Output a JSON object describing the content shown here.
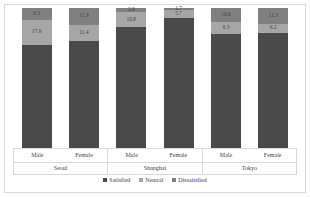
{
  "chart_data": {
    "type": "bar",
    "subtype": "100-percent-stacked-column",
    "title": "",
    "xlabel": "",
    "ylabel": "",
    "ylim": [
      0,
      100
    ],
    "grid": false,
    "legend_position": "bottom",
    "groups": [
      "Seoul",
      "Shanghai",
      "Tokyo"
    ],
    "categories": [
      "Male",
      "Female",
      "Male",
      "Female",
      "Male",
      "Female"
    ],
    "series": [
      {
        "name": "Satisfied",
        "color": "#4a4a4a",
        "values": [
          73.8,
          76.7,
          86.3,
          92.6,
          81.7,
          82.5
        ]
      },
      {
        "name": "Neutral",
        "color": "#a6a6a6",
        "values": [
          17.9,
          11.4,
          10.8,
          5.7,
          8.3,
          6.2
        ]
      },
      {
        "name": "Dissatisfied",
        "color": "#808080",
        "values": [
          8.3,
          11.9,
          2.9,
          1.7,
          10.0,
          11.3
        ]
      }
    ],
    "bars": [
      {
        "group": "Seoul",
        "category": "Male",
        "satisfied": 73.8,
        "neutral": 17.9,
        "dissatisfied": 8.3,
        "neutral_label": "17.9",
        "dissatisfied_label": "8.3",
        "satisfied_label": ""
      },
      {
        "group": "Seoul",
        "category": "Female",
        "satisfied": 76.7,
        "neutral": 11.4,
        "dissatisfied": 11.9,
        "neutral_label": "11.4",
        "dissatisfied_label": "11.9",
        "satisfied_label": ""
      },
      {
        "group": "Shanghai",
        "category": "Male",
        "satisfied": 86.3,
        "neutral": 10.8,
        "dissatisfied": 2.9,
        "neutral_label": "10.8",
        "dissatisfied_label": "2.9",
        "satisfied_label": ""
      },
      {
        "group": "Shanghai",
        "category": "Female",
        "satisfied": 92.6,
        "neutral": 5.7,
        "dissatisfied": 1.7,
        "neutral_label": "5.7",
        "dissatisfied_label": "1.7",
        "satisfied_label": ""
      },
      {
        "group": "Tokyo",
        "category": "Male",
        "satisfied": 81.7,
        "neutral": 8.3,
        "dissatisfied": 10.0,
        "neutral_label": "8.3",
        "dissatisfied_label": "10.0",
        "satisfied_label": ""
      },
      {
        "group": "Tokyo",
        "category": "Female",
        "satisfied": 82.5,
        "neutral": 6.2,
        "dissatisfied": 11.3,
        "neutral_label": "6.2",
        "dissatisfied_label": "11.3",
        "satisfied_label": ""
      }
    ]
  },
  "axis": {
    "groups": [
      {
        "name": "Seoul",
        "subcategories": [
          "Male",
          "Female"
        ]
      },
      {
        "name": "Shanghai",
        "subcategories": [
          "Male",
          "Female"
        ]
      },
      {
        "name": "Tokyo",
        "subcategories": [
          "Male",
          "Female"
        ]
      }
    ]
  },
  "legend": {
    "items": [
      {
        "label": "Satisfied",
        "color": "#4a4a4a"
      },
      {
        "label": "Neutral",
        "color": "#a6a6a6"
      },
      {
        "label": "Dissatisfied",
        "color": "#808080"
      }
    ]
  }
}
